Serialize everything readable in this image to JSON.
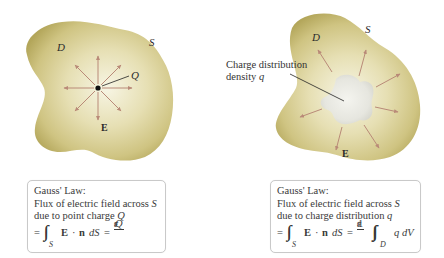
{
  "left_panel": {
    "surface_label": "S",
    "region_label": "D",
    "charge_label": "Q",
    "field_label": "E",
    "arrow_count": 8,
    "law_box": {
      "title": "Gauss' Law:",
      "line1_prefix": "Flux of electric field across ",
      "line1_var": "S",
      "line2_prefix": "due to point charge ",
      "line2_var": "Q",
      "eq_equals": "=",
      "eq_integral": "∫∫",
      "eq_integral_sub": "S",
      "eq_E": "E",
      "eq_dot": "·",
      "eq_n": "n",
      "eq_dS": "dS",
      "eq_equals2": "=",
      "frac_num": "Q",
      "frac_den": "ε",
      "frac_den_sub": "0"
    }
  },
  "right_panel": {
    "surface_label": "S",
    "region_label": "D",
    "field_label": "E",
    "callout_line1": "Charge distribution",
    "callout_line2_prefix": "density ",
    "callout_line2_var": "q",
    "arrow_count": 8,
    "law_box": {
      "title": "Gauss' Law:",
      "line1_prefix": "Flux of electric field across ",
      "line1_var": "S",
      "line2_prefix": "due to charge distribution ",
      "line2_var": "q",
      "eq_equals": "=",
      "eq_integral": "∫∫",
      "eq_integral_sub": "S",
      "eq_E": "E",
      "eq_dot": "·",
      "eq_n": "n",
      "eq_dS": "dS",
      "eq_equals2": "=",
      "frac_num": "1",
      "frac_den": "ε",
      "frac_den_sub": "0",
      "eq_triple_integral": "∫∫∫",
      "eq_triple_sub": "D",
      "eq_integrand": "q dV"
    }
  },
  "colors": {
    "blob_edge": "#b3a65a",
    "blob_mid": "#d8d09a",
    "blob_center": "#f4f1dc",
    "charge_cloud": "#e8e8e2",
    "arrow": "#b98a78",
    "leader_line": "#222222",
    "box_border": "#c9c9c9"
  }
}
